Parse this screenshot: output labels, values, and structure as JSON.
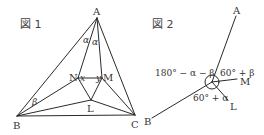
{
  "figure1": {
    "title": "図 1",
    "points": {
      "A": {
        "label": "A",
        "x": 97,
        "y": 18
      },
      "B": {
        "label": "B",
        "x": 17,
        "y": 116
      },
      "C": {
        "label": "C",
        "x": 135,
        "y": 115
      },
      "N": {
        "label": "N",
        "x": 78,
        "y": 78
      },
      "M": {
        "label": "M",
        "x": 102,
        "y": 78
      },
      "L": {
        "label": "L",
        "x": 91,
        "y": 100
      }
    },
    "angle_labels": {
      "alpha1": "α",
      "alpha2": "α",
      "x": "x",
      "y": "y",
      "beta": "β"
    }
  },
  "figure2": {
    "title": "図 2",
    "points": {
      "A": {
        "label": "A"
      },
      "M": {
        "label": "M"
      },
      "L": {
        "label": "L"
      },
      "B": {
        "label": "B"
      }
    },
    "angle_labels": {
      "left": "180° − α − β",
      "upper_right": "60° + β",
      "lower": "60° + α"
    }
  },
  "colors": {
    "line": "#2a2a2a",
    "text": "#333333",
    "background": "#ffffff"
  }
}
